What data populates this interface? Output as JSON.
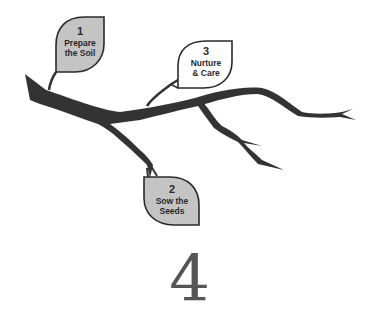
{
  "diagram": {
    "title_number": "4",
    "leaves": [
      {
        "number": "1",
        "line1": "Prepare",
        "line2": "the Soil",
        "fill": "#c4c4c4"
      },
      {
        "number": "2",
        "line1": "Sow the",
        "line2": "Seeds",
        "fill": "#c4c4c4"
      },
      {
        "number": "3",
        "line1": "Nurture",
        "line2": "& Care",
        "fill": "#ffffff"
      }
    ],
    "colors": {
      "branch": "#333333",
      "leaf_outline": "#2a2a2a",
      "number": "#555555"
    }
  }
}
